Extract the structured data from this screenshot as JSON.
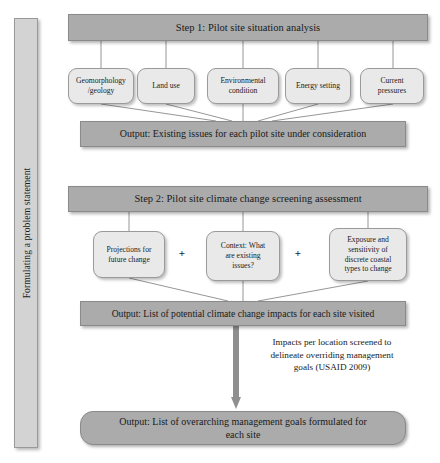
{
  "diagram": {
    "spine_label": "Formulating a problem statement",
    "colors": {
      "banner_fill": "#ababab",
      "factor_fill": "#e9e9e9",
      "spine_fill": "#d3d3d3",
      "border": "#8d8d8d",
      "arrow": "#8f8f8f",
      "text": "#1a1a1a",
      "background": "#ffffff"
    },
    "step1": {
      "banner": "Step 1: Pilot site situation analysis",
      "factors": [
        {
          "line1": "Geomorphology",
          "line2": "/geology"
        },
        {
          "line1": "Land use",
          "line2": ""
        },
        {
          "line1": "Environmental",
          "line2": "condition"
        },
        {
          "line1": "Energy setting",
          "line2": ""
        },
        {
          "line1": "Current",
          "line2": "pressures"
        }
      ],
      "output": "Output: Existing issues for each pilot site under consideration"
    },
    "step2": {
      "banner": "Step 2: Pilot site climate change screening assessment",
      "operators": [
        "+",
        "+"
      ],
      "factors": [
        {
          "lines": [
            "Projections for",
            "future change"
          ]
        },
        {
          "lines": [
            "Context: What",
            "are existing",
            "issues?"
          ]
        },
        {
          "lines": [
            "Exposure and",
            "sensitivity of",
            "discrete coastal",
            "types to change"
          ]
        }
      ],
      "output": "Output: List of potential climate change impacts for each site visited"
    },
    "arrow_note": {
      "lines": [
        "Impacts per location screened to",
        "delineate overriding management",
        "goals (USAID 2009)"
      ]
    },
    "final_output": {
      "lines": [
        "Output: List of overarching management goals formulated for",
        "each site"
      ]
    }
  }
}
